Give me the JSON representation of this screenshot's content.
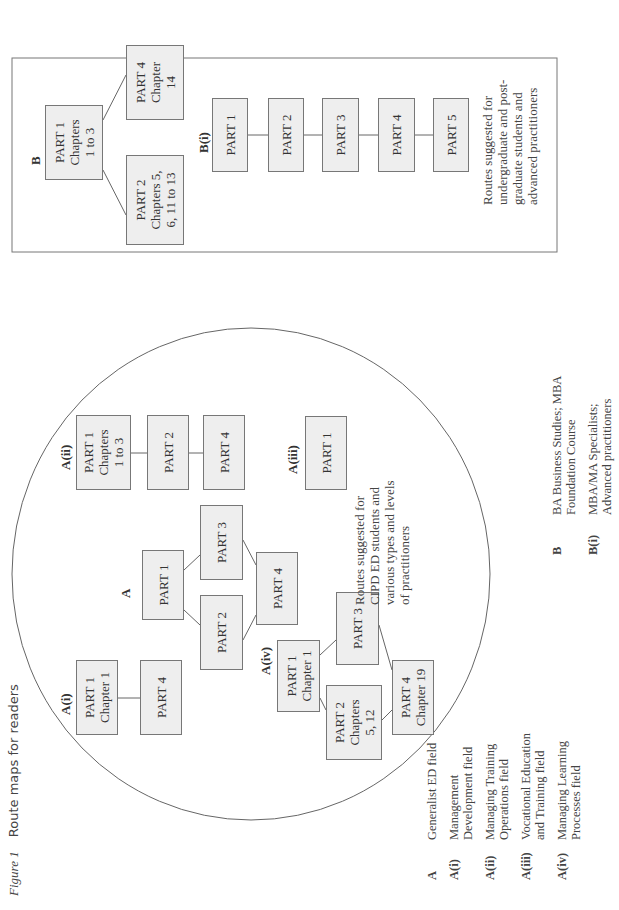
{
  "caption": {
    "figure": "Figure 1",
    "title": "Route maps for readers"
  },
  "colors": {
    "box_fill": "#eeeeee",
    "box_border": "#777777",
    "line": "#666666",
    "text": "#333333"
  },
  "groupA": {
    "note": "Routes suggested for\nCIPD ED students and\nvarious types and levels\nof practitioners",
    "A": {
      "label": "A",
      "nodes": [
        "PART 1",
        "PART 2",
        "PART 3",
        "PART 4"
      ]
    },
    "Ai": {
      "label": "A(i)",
      "nodes": [
        "PART 1\nChapter 1",
        "PART 4"
      ]
    },
    "Aii": {
      "label": "A(ii)",
      "nodes": [
        "PART 1\nChapters\n1 to 3",
        "PART 2",
        "PART 4"
      ]
    },
    "Aiii": {
      "label": "A(iii)",
      "nodes": [
        "PART 1"
      ]
    },
    "Aiv": {
      "label": "A(iv)",
      "nodes": [
        "PART 1\nChapter 1",
        "PART 2\nChapters\n5, 12",
        "PART 3",
        "PART 4\nChapter 19"
      ]
    }
  },
  "groupB": {
    "note": "Routes suggested for\nundergraduate and post-\ngraduate students and\nadvanced practitioners",
    "B": {
      "label": "B",
      "nodes": [
        "PART 1\nChapters\n1 to 3",
        "PART 2\nChapters 5,\n6, 11 to 13",
        "PART 4\nChapter\n14"
      ]
    },
    "Bi": {
      "label": "B(i)",
      "nodes": [
        "PART 1",
        "PART 2",
        "PART 3",
        "PART 4",
        "PART 5"
      ]
    }
  },
  "legendA": [
    {
      "key": "A",
      "text": "Generalist ED field"
    },
    {
      "key": "A(i)",
      "text": "Management\nDevelopment field"
    },
    {
      "key": "A(ii)",
      "text": "Managing Training\nOperations field"
    },
    {
      "key": "A(iii)",
      "text": "Vocational Education\nand Training field"
    },
    {
      "key": "A(iv)",
      "text": "Managing Learning\nProcesses field"
    }
  ],
  "legendB": [
    {
      "key": "B",
      "text": "BA Business Studies; MBA\nFoundation Course"
    },
    {
      "key": "B(i)",
      "text": "MBA/MA Specialists;\nAdvanced practitioners"
    }
  ]
}
